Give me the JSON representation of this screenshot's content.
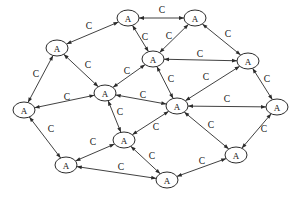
{
  "diagram": {
    "node_label": "A",
    "edge_label": "C",
    "node_fill": "#ffffff",
    "node_stroke": "#2b2b2b",
    "edge_stroke": "#2b2b2b",
    "background": "#ffffff",
    "node_rx": 11,
    "node_ry": 8,
    "nodes": [
      {
        "id": "n1",
        "label": "A",
        "x": 128,
        "y": 18
      },
      {
        "id": "n2",
        "label": "A",
        "x": 195,
        "y": 18
      },
      {
        "id": "n3",
        "label": "A",
        "x": 57,
        "y": 48
      },
      {
        "id": "n4",
        "label": "A",
        "x": 153,
        "y": 59
      },
      {
        "id": "n5",
        "label": "A",
        "x": 248,
        "y": 61
      },
      {
        "id": "n6",
        "label": "A",
        "x": 24,
        "y": 110
      },
      {
        "id": "n7",
        "label": "A",
        "x": 105,
        "y": 93
      },
      {
        "id": "n8",
        "label": "A",
        "x": 177,
        "y": 106
      },
      {
        "id": "n9",
        "label": "A",
        "x": 277,
        "y": 107
      },
      {
        "id": "n10",
        "label": "A",
        "x": 124,
        "y": 140
      },
      {
        "id": "n11",
        "label": "A",
        "x": 66,
        "y": 165
      },
      {
        "id": "n12",
        "label": "A",
        "x": 167,
        "y": 180
      },
      {
        "id": "n13",
        "label": "A",
        "x": 236,
        "y": 155
      }
    ],
    "edges": [
      {
        "id": "e1",
        "from": "n1",
        "to": "n2",
        "label": "C",
        "lx": 162,
        "ly": 11
      },
      {
        "id": "e2",
        "from": "n3",
        "to": "n1",
        "label": "C",
        "lx": 89,
        "ly": 27
      },
      {
        "id": "e3",
        "from": "n1",
        "to": "n4",
        "label": "C",
        "lx": 145,
        "ly": 38
      },
      {
        "id": "e4",
        "from": "n2",
        "to": "n4",
        "label": "C",
        "lx": 169,
        "ly": 37
      },
      {
        "id": "e5",
        "from": "n2",
        "to": "n5",
        "label": "C",
        "lx": 228,
        "ly": 35
      },
      {
        "id": "e6",
        "from": "n4",
        "to": "n5",
        "label": "C",
        "lx": 200,
        "ly": 55
      },
      {
        "id": "e7",
        "from": "n4",
        "to": "n7",
        "label": "C",
        "lx": 127,
        "ly": 72
      },
      {
        "id": "e8",
        "from": "n4",
        "to": "n8",
        "label": "C",
        "lx": 171,
        "ly": 80
      },
      {
        "id": "e9",
        "from": "n3",
        "to": "n6",
        "label": "C",
        "lx": 36,
        "ly": 75
      },
      {
        "id": "e10",
        "from": "n3",
        "to": "n7",
        "label": "C",
        "lx": 88,
        "ly": 66
      },
      {
        "id": "e11",
        "from": "n6",
        "to": "n7",
        "label": "C",
        "lx": 67,
        "ly": 98
      },
      {
        "id": "e12",
        "from": "n6",
        "to": "n11",
        "label": "C",
        "lx": 51,
        "ly": 130
      },
      {
        "id": "e13",
        "from": "n7",
        "to": "n8",
        "label": "C",
        "lx": 143,
        "ly": 96
      },
      {
        "id": "e14",
        "from": "n7",
        "to": "n10",
        "label": "C",
        "lx": 120,
        "ly": 113
      },
      {
        "id": "e15",
        "from": "n5",
        "to": "n8",
        "label": "C",
        "lx": 206,
        "ly": 78
      },
      {
        "id": "e16",
        "from": "n5",
        "to": "n9",
        "label": "C",
        "lx": 267,
        "ly": 80
      },
      {
        "id": "e17",
        "from": "n8",
        "to": "n9",
        "label": "C",
        "lx": 227,
        "ly": 100
      },
      {
        "id": "e18",
        "from": "n8",
        "to": "n10",
        "label": "C",
        "lx": 156,
        "ly": 128
      },
      {
        "id": "e19",
        "from": "n8",
        "to": "n13",
        "label": "C",
        "lx": 211,
        "ly": 126
      },
      {
        "id": "e20",
        "from": "n9",
        "to": "n13",
        "label": "C",
        "lx": 264,
        "ly": 130
      },
      {
        "id": "e21",
        "from": "n10",
        "to": "n11",
        "label": "C",
        "lx": 93,
        "ly": 143
      },
      {
        "id": "e22",
        "from": "n10",
        "to": "n12",
        "label": "C",
        "lx": 152,
        "ly": 157
      },
      {
        "id": "e23",
        "from": "n11",
        "to": "n12",
        "label": "C",
        "lx": 121,
        "ly": 168
      },
      {
        "id": "e24",
        "from": "n12",
        "to": "n13",
        "label": "C",
        "lx": 202,
        "ly": 162
      }
    ]
  }
}
